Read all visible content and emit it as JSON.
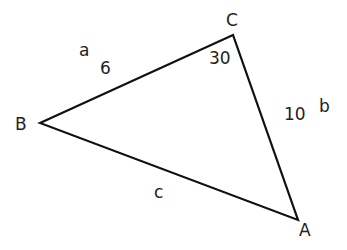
{
  "diagram": {
    "type": "triangle",
    "vertices": [
      {
        "name": "A",
        "x": 298,
        "y": 220
      },
      {
        "name": "B",
        "x": 40,
        "y": 123
      },
      {
        "name": "C",
        "x": 233,
        "y": 35
      }
    ],
    "side_labels": {
      "a": "a",
      "b": "b",
      "c": "c"
    },
    "values": {
      "side_a": "6",
      "side_b": "10",
      "angle_C": "30"
    },
    "stroke_color": "#111111"
  }
}
